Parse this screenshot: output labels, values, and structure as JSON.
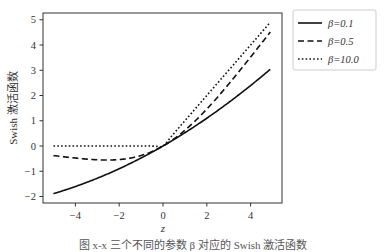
{
  "chart_data": {
    "type": "line",
    "title": "",
    "xlabel": "z",
    "ylabel": "Swish 激活函数",
    "xlim": [
      -5.25,
      5.2
    ],
    "ylim": [
      -2.25,
      5.25
    ],
    "xticks": [
      -4,
      -2,
      0,
      2,
      4
    ],
    "xtick_labels": [
      "−4",
      "−2",
      "0",
      "2",
      "4"
    ],
    "yticks": [
      -2,
      -1,
      0,
      1,
      2,
      3,
      4,
      5
    ],
    "ytick_labels": [
      "−2",
      "−1",
      "0",
      "1",
      "2",
      "3",
      "4",
      "5"
    ],
    "grid": false,
    "legend_position": "outside upper right",
    "x": [
      -5,
      -4.5,
      -4,
      -3.5,
      -3,
      -2.5,
      -2,
      -1.5,
      -1,
      -0.5,
      0,
      0.5,
      1,
      1.5,
      2,
      2.5,
      3,
      3.5,
      4,
      4.5,
      4.9
    ],
    "series": [
      {
        "name": "β=0.1",
        "style": "solid",
        "values": [
          -1.888,
          -1.752,
          -1.6,
          -1.434,
          -1.256,
          -1.066,
          -0.9,
          -0.694,
          -0.475,
          -0.244,
          0,
          0.256,
          0.525,
          0.806,
          1.1,
          1.406,
          1.724,
          2.066,
          2.4,
          2.748,
          3.03
        ]
      },
      {
        "name": "β=0.5",
        "style": "dashed",
        "values": [
          -0.38,
          -0.428,
          -0.477,
          -0.516,
          -0.546,
          -0.555,
          -0.538,
          -0.481,
          -0.378,
          -0.219,
          0,
          0.281,
          0.622,
          1.019,
          1.462,
          1.945,
          2.454,
          2.984,
          3.523,
          4.072,
          4.51
        ]
      },
      {
        "name": "β=10.0",
        "style": "dotted",
        "values": [
          0,
          0,
          0,
          0,
          0,
          0,
          0,
          0,
          0,
          -0.003,
          0,
          0.497,
          1.0,
          1.5,
          2.0,
          2.5,
          3.0,
          3.5,
          4.0,
          4.5,
          4.9
        ]
      }
    ]
  },
  "legend": {
    "items": [
      {
        "label": "β=0.1",
        "style": "solid"
      },
      {
        "label": "β=0.5",
        "style": "dashed"
      },
      {
        "label": "β=10.0",
        "style": "dotted"
      }
    ]
  },
  "caption": "图 x-x  三个不同的参数 β 对应的 Swish 激活函数",
  "colors": {
    "line": "#111111",
    "axis": "#333333",
    "legend_border": "#cccccc"
  }
}
